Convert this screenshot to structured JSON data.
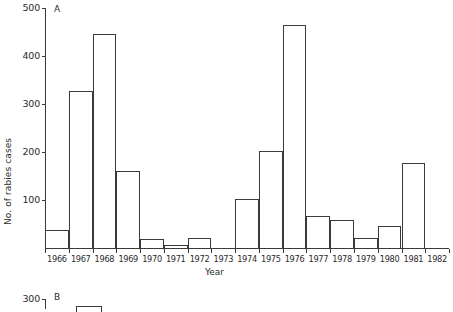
{
  "figure": {
    "panels": [
      {
        "letter": "A",
        "xlabel": "Year",
        "ylabel": "No. of rabies cases"
      },
      {
        "letter": "B"
      }
    ]
  },
  "panelA": {
    "letter": "A",
    "xlabel": "Year",
    "ylabel": "No. of rabies cases",
    "ytick_labels": [
      "500",
      "400",
      "300",
      "200",
      "100"
    ],
    "xtick_labels": [
      "1966",
      "1967",
      "1968",
      "1969",
      "1970",
      "1971",
      "1972",
      "1973",
      "1974",
      "1975",
      "1976",
      "1977",
      "1978",
      "1979",
      "1980",
      "1981",
      "1982"
    ]
  },
  "panelB": {
    "letter": "B",
    "ytick_labels": [
      "300"
    ]
  },
  "colors": {
    "axis": "#3a3a3a",
    "bar_stroke": "#3a3a3a",
    "bar_fill": "#ffffff",
    "background": "#ffffff",
    "text": "#2b2b2b"
  },
  "chart_data": [
    {
      "type": "bar",
      "title": "A",
      "xlabel": "Year",
      "ylabel": "No. of rabies cases",
      "categories": [
        "1966",
        "1967",
        "1968",
        "1969",
        "1970",
        "1971",
        "1972",
        "1973",
        "1974",
        "1975",
        "1976",
        "1977",
        "1978",
        "1979",
        "1980",
        "1981",
        "1982"
      ],
      "values": [
        38,
        327,
        445,
        161,
        18,
        7,
        20,
        0,
        103,
        203,
        465,
        67,
        59,
        21,
        46,
        178,
        0
      ],
      "ylim": [
        0,
        500
      ],
      "yticks": [
        100,
        200,
        300,
        400,
        500
      ],
      "grid": false,
      "legend": false,
      "style": "outlined histogram bars, no fill"
    },
    {
      "type": "bar",
      "title": "B",
      "ylim": [
        0,
        300
      ],
      "yticks": [
        300
      ],
      "grid": false,
      "legend": false,
      "note": "panel B is cut off at the bottom edge of the screenshot; only the 300 tick, the B label and the top edge of one bar are visible",
      "categories": [],
      "values": []
    }
  ]
}
